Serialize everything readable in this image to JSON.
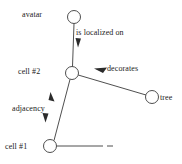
{
  "diagram": {
    "background_color": "#ffffff",
    "stroke_color": "#3b3b3b",
    "text_color": "#1a1a1a",
    "nodes": [
      {
        "id": "avatar",
        "label": "avatar",
        "cx": 74,
        "cy": 17,
        "r": 6.5,
        "label_side": "left"
      },
      {
        "id": "cell2",
        "label": "cell #2",
        "cx": 72,
        "cy": 73,
        "r": 6.5,
        "label_side": "left"
      },
      {
        "id": "tree",
        "label": "tree",
        "cx": 152,
        "cy": 97,
        "r": 6.5,
        "label_side": "right"
      },
      {
        "id": "cell1",
        "label": "cell #1",
        "cx": 50,
        "cy": 146,
        "r": 6.5,
        "label_side": "left"
      }
    ],
    "edges": [
      {
        "id": "avatar-cell2",
        "from": "avatar",
        "to": "cell2",
        "label": "is localized on",
        "arrow": "single-down"
      },
      {
        "id": "cell2-tree",
        "from": "cell2",
        "to": "tree",
        "label": "decorates",
        "arrow": "single-back"
      },
      {
        "id": "cell2-cell1",
        "from": "cell2",
        "to": "cell1",
        "label": "adjacency",
        "arrow": "double"
      },
      {
        "id": "cell1-cut",
        "from": "cell1",
        "to": "(clipped)",
        "label": "",
        "arrow": "none"
      }
    ]
  }
}
